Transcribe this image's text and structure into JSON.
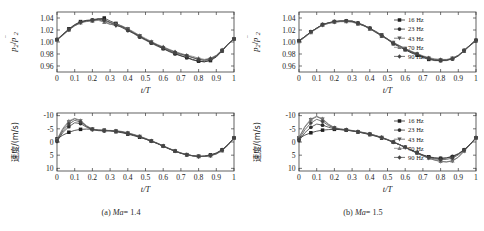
{
  "figure": {
    "background": "#ffffff",
    "panel_captions": [
      {
        "id": "a",
        "prefix": "(a)",
        "symbol": "Ma",
        "value": "= 1.4"
      },
      {
        "id": "b",
        "prefix": "(b)",
        "symbol": "Ma",
        "value": "= 1.5"
      }
    ]
  },
  "legend": {
    "position": "top-right",
    "entries": [
      {
        "label": "16 Hz",
        "marker": "square",
        "color": "#1f1f1f"
      },
      {
        "label": "23 Hz",
        "marker": "circle",
        "color": "#2e2e2e"
      },
      {
        "label": "43 Hz",
        "marker": "triangle-down",
        "color": "#555555"
      },
      {
        "label": "70 Hz",
        "marker": "triangle-up",
        "color": "#777777"
      },
      {
        "label": "90 Hz",
        "marker": "diamond",
        "color": "#444444"
      }
    ]
  },
  "axes": {
    "x_label": "t/T",
    "x_ticks": [
      "0",
      "0.1",
      "0.2",
      "0.3",
      "0.4",
      "0.5",
      "0.6",
      "0.7",
      "0.8",
      "0.9",
      "1"
    ],
    "x_tick_values": [
      0,
      0.1,
      0.2,
      0.3,
      0.4,
      0.5,
      0.6,
      0.7,
      0.8,
      0.9,
      1
    ],
    "xlim": [
      0,
      1
    ],
    "pressure_y_label": "p2/p2bar",
    "pressure_y_ticks": [
      "1.04",
      "1.02",
      "1.00",
      "0.98",
      "0.96"
    ],
    "pressure_y_tick_values": [
      1.04,
      1.02,
      1.0,
      0.98,
      0.96
    ],
    "pressure_ylim": [
      0.95,
      1.05
    ],
    "velocity_y_label": "速度/(m/s)",
    "velocity_y_ticks": [
      "-10",
      "-5",
      "0",
      "5",
      "10"
    ],
    "velocity_y_tick_values": [
      -10,
      -5,
      0,
      5,
      10
    ],
    "velocity_ylim": [
      -11,
      11
    ],
    "velocity_inverted": true
  },
  "chart_data": [
    {
      "type": "line",
      "id": "a-pressure",
      "title": "",
      "xlabel": "t/T",
      "ylabel": "p2/p2bar",
      "xlim": [
        0,
        1
      ],
      "ylim": [
        0.95,
        1.05
      ],
      "y_inverted": false,
      "grid": false,
      "legend": false,
      "x": [
        0,
        0.033,
        0.067,
        0.1,
        0.133,
        0.167,
        0.2,
        0.233,
        0.267,
        0.3,
        0.333,
        0.367,
        0.4,
        0.433,
        0.467,
        0.5,
        0.533,
        0.567,
        0.6,
        0.633,
        0.667,
        0.7,
        0.733,
        0.767,
        0.8,
        0.833,
        0.867,
        0.9,
        0.933,
        0.967,
        1
      ],
      "series": [
        {
          "name": "16 Hz",
          "marker": "square",
          "values": [
            1.004,
            1.013,
            1.022,
            1.029,
            1.034,
            1.036,
            1.036,
            1.038,
            1.04,
            1.035,
            1.031,
            1.026,
            1.021,
            1.015,
            1.01,
            1.004,
            0.999,
            0.994,
            0.989,
            0.985,
            0.981,
            0.977,
            0.974,
            0.971,
            0.968,
            0.967,
            0.969,
            0.975,
            0.985,
            0.996,
            1.005
          ]
        },
        {
          "name": "23 Hz",
          "marker": "circle",
          "values": [
            1.004,
            1.012,
            1.021,
            1.028,
            1.033,
            1.036,
            1.037,
            1.039,
            1.037,
            1.033,
            1.029,
            1.024,
            1.019,
            1.014,
            1.008,
            1.003,
            0.998,
            0.993,
            0.989,
            0.984,
            0.98,
            0.977,
            0.974,
            0.97,
            0.968,
            0.967,
            0.97,
            0.976,
            0.986,
            0.997,
            1.005
          ]
        },
        {
          "name": "43 Hz",
          "marker": "triangle-down",
          "values": [
            1.003,
            1.012,
            1.02,
            1.027,
            1.032,
            1.035,
            1.036,
            1.037,
            1.034,
            1.03,
            1.027,
            1.026,
            1.022,
            1.016,
            1.01,
            1.005,
            1.0,
            0.995,
            0.99,
            0.986,
            0.982,
            0.979,
            0.977,
            0.974,
            0.971,
            0.969,
            0.971,
            0.977,
            0.986,
            0.997,
            1.005
          ]
        },
        {
          "name": "70 Hz",
          "marker": "triangle-up",
          "values": [
            1.003,
            1.011,
            1.02,
            1.027,
            1.032,
            1.034,
            1.035,
            1.036,
            1.033,
            1.029,
            1.03,
            1.027,
            1.022,
            1.017,
            1.011,
            1.006,
            1.001,
            0.996,
            0.992,
            0.988,
            0.984,
            0.981,
            0.978,
            0.976,
            0.973,
            0.971,
            0.973,
            0.978,
            0.987,
            0.997,
            1.005
          ]
        },
        {
          "name": "90 Hz",
          "marker": "diamond",
          "values": [
            1.004,
            1.012,
            1.021,
            1.028,
            1.033,
            1.035,
            1.036,
            1.038,
            1.036,
            1.032,
            1.028,
            1.025,
            1.02,
            1.015,
            1.009,
            1.004,
            0.999,
            0.995,
            0.991,
            0.987,
            0.983,
            0.98,
            0.977,
            0.974,
            0.971,
            0.97,
            0.972,
            0.977,
            0.986,
            0.997,
            1.005
          ]
        }
      ]
    },
    {
      "type": "line",
      "id": "b-pressure",
      "title": "",
      "xlabel": "t/T",
      "ylabel": "p2/p2bar",
      "xlim": [
        0,
        1
      ],
      "ylim": [
        0.95,
        1.05
      ],
      "y_inverted": false,
      "grid": false,
      "legend": true,
      "x": [
        0,
        0.033,
        0.067,
        0.1,
        0.133,
        0.167,
        0.2,
        0.233,
        0.267,
        0.3,
        0.333,
        0.367,
        0.4,
        0.433,
        0.467,
        0.5,
        0.533,
        0.567,
        0.6,
        0.633,
        0.667,
        0.7,
        0.733,
        0.767,
        0.8,
        0.833,
        0.867,
        0.9,
        0.933,
        0.967,
        1
      ],
      "series": [
        {
          "name": "16 Hz",
          "marker": "square",
          "values": [
            1.002,
            1.009,
            1.017,
            1.023,
            1.029,
            1.032,
            1.034,
            1.035,
            1.035,
            1.035,
            1.031,
            1.027,
            1.022,
            1.016,
            1.01,
            1.004,
            0.997,
            0.992,
            0.987,
            0.982,
            0.978,
            0.974,
            0.971,
            0.969,
            0.969,
            0.969,
            0.972,
            0.977,
            0.985,
            0.994,
            1.002
          ]
        },
        {
          "name": "23 Hz",
          "marker": "circle",
          "values": [
            1.002,
            1.009,
            1.017,
            1.023,
            1.029,
            1.032,
            1.034,
            1.035,
            1.035,
            1.035,
            1.032,
            1.028,
            1.023,
            1.017,
            1.011,
            1.005,
            0.998,
            0.993,
            0.988,
            0.983,
            0.979,
            0.975,
            0.972,
            0.97,
            0.969,
            0.97,
            0.972,
            0.977,
            0.986,
            0.995,
            1.003
          ]
        },
        {
          "name": "43 Hz",
          "marker": "triangle-down",
          "values": [
            1.001,
            1.008,
            1.016,
            1.023,
            1.028,
            1.031,
            1.033,
            1.034,
            1.034,
            1.034,
            1.031,
            1.028,
            1.023,
            1.018,
            1.012,
            1.005,
            0.999,
            0.994,
            0.989,
            0.984,
            0.98,
            0.976,
            0.973,
            0.971,
            0.97,
            0.97,
            0.973,
            0.978,
            0.986,
            0.995,
            1.003
          ]
        },
        {
          "name": "70 Hz",
          "marker": "triangle-up",
          "values": [
            1.001,
            1.008,
            1.016,
            1.022,
            1.028,
            1.031,
            1.033,
            1.034,
            1.034,
            1.033,
            1.03,
            1.027,
            1.022,
            1.017,
            1.011,
            1.005,
            0.999,
            0.994,
            0.989,
            0.985,
            0.981,
            0.977,
            0.974,
            0.972,
            0.971,
            0.971,
            0.973,
            0.978,
            0.986,
            0.995,
            1.003
          ]
        },
        {
          "name": "90 Hz",
          "marker": "diamond",
          "values": [
            1.002,
            1.009,
            1.017,
            1.023,
            1.029,
            1.032,
            1.034,
            1.035,
            1.035,
            1.034,
            1.031,
            1.027,
            1.023,
            1.017,
            1.011,
            1.005,
            0.998,
            0.993,
            0.988,
            0.984,
            0.98,
            0.976,
            0.973,
            0.97,
            0.97,
            0.97,
            0.972,
            0.977,
            0.986,
            0.995,
            1.003
          ]
        }
      ]
    },
    {
      "type": "line",
      "id": "a-velocity",
      "title": "",
      "xlabel": "t/T",
      "ylabel": "速度/(m/s)",
      "xlim": [
        0,
        1
      ],
      "ylim": [
        -11,
        11
      ],
      "y_inverted": true,
      "grid": false,
      "legend": false,
      "x": [
        0,
        0.033,
        0.067,
        0.1,
        0.133,
        0.167,
        0.2,
        0.233,
        0.267,
        0.3,
        0.333,
        0.367,
        0.4,
        0.433,
        0.467,
        0.5,
        0.533,
        0.567,
        0.6,
        0.633,
        0.667,
        0.7,
        0.733,
        0.767,
        0.8,
        0.833,
        0.867,
        0.9,
        0.933,
        0.967,
        1
      ],
      "series": [
        {
          "name": "16 Hz",
          "marker": "square",
          "values": [
            -1.2,
            -2.6,
            -3.7,
            -4.4,
            -4.8,
            -4.9,
            -4.8,
            -4.6,
            -4.5,
            -4.3,
            -3.9,
            -3.5,
            -3.0,
            -2.4,
            -1.8,
            -1.1,
            -0.3,
            0.6,
            1.6,
            2.6,
            3.5,
            4.3,
            4.8,
            5.2,
            5.4,
            5.3,
            4.9,
            4.2,
            3.0,
            1.0,
            -1.5
          ]
        },
        {
          "name": "23 Hz",
          "marker": "circle",
          "values": [
            -0.2,
            -3.6,
            -5.8,
            -7.3,
            -7.0,
            -5.6,
            -4.7,
            -4.3,
            -4.2,
            -4.2,
            -4.1,
            -3.7,
            -3.2,
            -2.6,
            -1.9,
            -1.1,
            -0.3,
            0.6,
            1.6,
            2.6,
            3.5,
            4.3,
            4.9,
            5.3,
            5.5,
            5.4,
            5.0,
            4.2,
            2.9,
            0.9,
            -1.6
          ]
        },
        {
          "name": "43 Hz",
          "marker": "triangle-down",
          "values": [
            -0.8,
            -4.8,
            -7.6,
            -8.8,
            -8.0,
            -6.0,
            -4.8,
            -4.4,
            -4.3,
            -4.3,
            -4.2,
            -3.9,
            -3.4,
            -2.8,
            -2.1,
            -1.3,
            -0.4,
            0.5,
            1.5,
            2.5,
            3.4,
            4.2,
            4.8,
            5.2,
            5.5,
            5.5,
            5.2,
            4.5,
            3.2,
            1.1,
            -1.5
          ]
        },
        {
          "name": "70 Hz",
          "marker": "triangle-up",
          "values": [
            -1.0,
            -5.2,
            -8.0,
            -9.0,
            -8.2,
            -6.2,
            -4.9,
            -4.5,
            -4.4,
            -4.4,
            -4.3,
            -4.0,
            -3.5,
            -2.9,
            -2.2,
            -1.4,
            -0.5,
            0.4,
            1.4,
            2.4,
            3.3,
            4.1,
            4.8,
            5.2,
            5.5,
            5.5,
            5.2,
            4.6,
            3.3,
            1.2,
            -1.4
          ]
        },
        {
          "name": "90 Hz",
          "marker": "diamond",
          "values": [
            -0.6,
            -4.2,
            -6.8,
            -8.2,
            -7.6,
            -5.9,
            -4.8,
            -4.4,
            -4.3,
            -4.3,
            -4.1,
            -3.8,
            -3.3,
            -2.7,
            -2.0,
            -1.2,
            -0.4,
            0.5,
            1.5,
            2.5,
            3.4,
            4.2,
            4.8,
            5.2,
            5.5,
            5.4,
            5.1,
            4.4,
            3.1,
            1.0,
            -1.5
          ]
        }
      ]
    },
    {
      "type": "line",
      "id": "b-velocity",
      "title": "",
      "xlabel": "t/T",
      "ylabel": "速度/(m/s)",
      "xlim": [
        -11,
        11
      ],
      "ylim": [
        -11,
        11
      ],
      "y_inverted": true,
      "grid": false,
      "legend": true,
      "x": [
        0,
        0.033,
        0.067,
        0.1,
        0.133,
        0.167,
        0.2,
        0.233,
        0.267,
        0.3,
        0.333,
        0.367,
        0.4,
        0.433,
        0.467,
        0.5,
        0.533,
        0.567,
        0.6,
        0.633,
        0.667,
        0.7,
        0.733,
        0.767,
        0.8,
        0.833,
        0.867,
        0.9,
        0.933,
        0.967,
        1
      ],
      "series": [
        {
          "name": "16 Hz",
          "marker": "square",
          "values": [
            -1.4,
            -2.6,
            -3.5,
            -4.1,
            -4.5,
            -4.7,
            -4.8,
            -4.7,
            -4.5,
            -4.2,
            -3.8,
            -3.3,
            -2.8,
            -2.2,
            -1.5,
            -0.8,
            0.1,
            1.0,
            2.0,
            3.0,
            4.0,
            4.9,
            5.6,
            6.0,
            6.2,
            6.1,
            5.6,
            4.6,
            3.0,
            0.9,
            -1.6
          ]
        },
        {
          "name": "23 Hz",
          "marker": "circle",
          "values": [
            -0.5,
            -3.5,
            -5.6,
            -6.8,
            -6.4,
            -5.6,
            -5.0,
            -4.7,
            -4.5,
            -4.2,
            -3.8,
            -3.4,
            -2.9,
            -2.3,
            -1.6,
            -0.8,
            0.1,
            1.0,
            2.0,
            3.1,
            4.1,
            5.0,
            5.7,
            6.1,
            6.2,
            6.0,
            5.4,
            4.4,
            2.9,
            0.8,
            -1.7
          ]
        },
        {
          "name": "43 Hz",
          "marker": "triangle-down",
          "values": [
            -1.6,
            -5.6,
            -8.4,
            -9.6,
            -8.6,
            -6.6,
            -5.4,
            -4.9,
            -4.6,
            -4.3,
            -3.9,
            -3.5,
            -3.0,
            -2.4,
            -1.7,
            -0.9,
            0.0,
            1.0,
            2.1,
            3.2,
            4.3,
            5.3,
            6.2,
            6.9,
            7.4,
            7.6,
            7.2,
            5.8,
            3.5,
            1.0,
            -1.5
          ]
        },
        {
          "name": "70 Hz",
          "marker": "triangle-up",
          "values": [
            -1.8,
            -5.9,
            -8.7,
            -9.8,
            -8.8,
            -6.8,
            -5.5,
            -5.0,
            -4.7,
            -4.4,
            -4.0,
            -3.6,
            -3.1,
            -2.5,
            -1.8,
            -1.0,
            -0.1,
            0.9,
            2.0,
            3.1,
            4.2,
            5.2,
            6.1,
            6.8,
            7.3,
            7.5,
            7.1,
            5.7,
            3.4,
            1.0,
            -1.5
          ]
        },
        {
          "name": "90 Hz",
          "marker": "diamond",
          "values": [
            -1.0,
            -4.6,
            -7.2,
            -8.6,
            -7.8,
            -6.2,
            -5.2,
            -4.8,
            -4.6,
            -4.3,
            -3.9,
            -3.5,
            -3.0,
            -2.4,
            -1.7,
            -0.9,
            0.0,
            1.0,
            2.0,
            3.1,
            4.1,
            5.1,
            5.9,
            6.4,
            6.7,
            6.6,
            6.1,
            4.9,
            3.1,
            0.9,
            -1.6
          ]
        }
      ]
    }
  ]
}
